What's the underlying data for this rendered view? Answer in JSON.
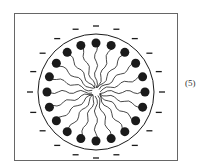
{
  "figure": {
    "label": "(5)",
    "center": [
      96,
      92
    ],
    "circle_radius": 58,
    "head_radius_pos": 49,
    "head_size": 4.5,
    "charge_radius": 66,
    "count": 20,
    "colors": {
      "ink": "#1a1a1a",
      "frame": "#666666",
      "background": "#ffffff"
    }
  }
}
